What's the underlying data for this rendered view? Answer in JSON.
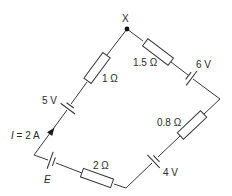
{
  "diagram": {
    "type": "circuit",
    "node": {
      "label": "X"
    },
    "current": {
      "symbol": "I",
      "text": " = 2 A",
      "value": "2 A"
    },
    "components": [
      {
        "kind": "resistor",
        "label": "1 Ω",
        "edge": "left-upper"
      },
      {
        "kind": "cell",
        "label": "5 V",
        "edge": "left-upper"
      },
      {
        "kind": "resistor",
        "label": "1.5 Ω",
        "edge": "right-upper"
      },
      {
        "kind": "cell",
        "label": "6 V",
        "edge": "right-upper"
      },
      {
        "kind": "resistor",
        "label": "0.8 Ω",
        "edge": "right-lower"
      },
      {
        "kind": "cell",
        "label": "4 V",
        "edge": "right-lower"
      },
      {
        "kind": "resistor",
        "label": "2 Ω",
        "edge": "left-lower"
      },
      {
        "kind": "cell",
        "label": "E",
        "edge": "left-lower"
      }
    ],
    "labels": {
      "x": "X",
      "r1": "1 Ω",
      "v5": "5 V",
      "r15": "1.5 Ω",
      "v6": "6 V",
      "r08": "0.8 Ω",
      "v4": "4 V",
      "r2": "2 Ω",
      "e": "E",
      "i_symbol": "I",
      "i_rest": " = 2 A"
    },
    "colors": {
      "line": "#3a3a3a",
      "text": "#2a2a2a",
      "background": "#ffffff"
    }
  }
}
